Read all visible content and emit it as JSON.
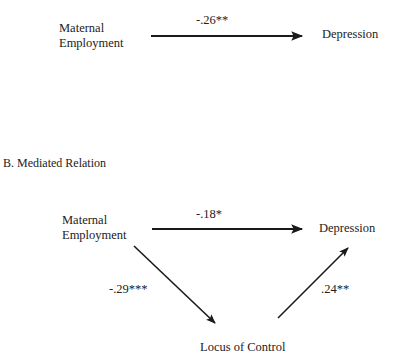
{
  "panel_a": {
    "source_label_line1": "Maternal",
    "source_label_line2": "Employment",
    "target_label": "Depression",
    "path_coefficient": "-.26**"
  },
  "panel_b": {
    "title": "B.  Mediated Relation",
    "source_label_line1": "Maternal",
    "source_label_line2": "Employment",
    "target_label": "Depression",
    "mediator_label": "Locus of Control",
    "direct_coefficient": "-.18*",
    "a_path_coefficient": "-.29***",
    "b_path_coefficient": ".24**"
  },
  "colors": {
    "line": "#1a1a1a",
    "text": "#222222"
  }
}
